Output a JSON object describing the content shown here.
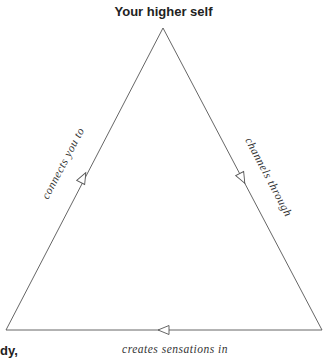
{
  "diagram": {
    "top_node": "Your higher self",
    "bottom_left_node_partial": "dy,",
    "edges": {
      "left": "connects you to",
      "right": "channels through",
      "bottom": "creates sensations in"
    },
    "line_color": "#555555"
  }
}
